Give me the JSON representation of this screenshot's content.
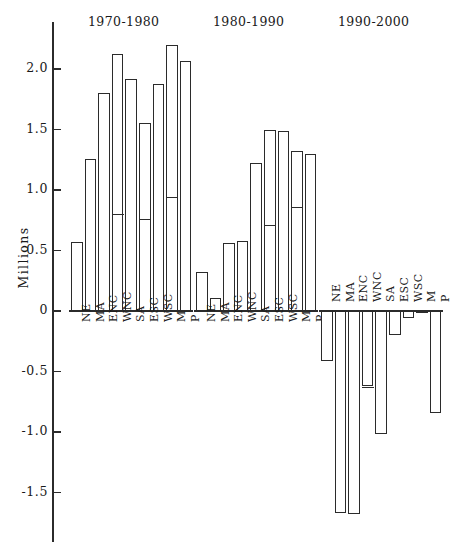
{
  "axis": {
    "y_title": "Millions",
    "ticks": [
      {
        "label": "2.0",
        "value": 2.0
      },
      {
        "label": "1.5",
        "value": 1.5
      },
      {
        "label": "1.0",
        "value": 1.0
      },
      {
        "label": "0.5",
        "value": 0.5
      },
      {
        "label": "0",
        "value": 0.0
      },
      {
        "label": "-0.5",
        "value": -0.5
      },
      {
        "label": "-1.0",
        "value": -1.0
      },
      {
        "label": "-1.5",
        "value": -1.5
      }
    ]
  },
  "chart_data": {
    "type": "bar",
    "title": "",
    "xlabel": "",
    "ylabel": "Millions",
    "ylim": [
      -1.8,
      2.3
    ],
    "grid": false,
    "legend": "none",
    "categories": [
      "NE",
      "MA",
      "ENC",
      "WNC",
      "SA",
      "ESC",
      "WSC",
      "M",
      "P"
    ],
    "panels": [
      {
        "title": "1970-1980",
        "values": [
          0.57,
          1.26,
          1.8,
          2.12,
          1.92,
          1.55,
          1.88,
          2.2,
          2.07
        ],
        "inner_marks": [
          null,
          null,
          null,
          0.81,
          null,
          0.77,
          null,
          0.95,
          null
        ]
      },
      {
        "title": "1980-1990",
        "values": [
          0.32,
          0.11,
          0.56,
          0.58,
          1.22,
          1.5,
          1.49,
          1.32,
          1.3
        ],
        "inner_marks": [
          null,
          null,
          null,
          null,
          null,
          0.72,
          null,
          0.87,
          null
        ]
      },
      {
        "title": "1990-2000",
        "values": [
          -0.41,
          -1.67,
          -1.68,
          -0.62,
          -1.02,
          -0.2,
          -0.06,
          -0.02,
          -0.84
        ],
        "inner_marks": [
          null,
          null,
          null,
          -0.62,
          null,
          null,
          null,
          null,
          null
        ]
      }
    ]
  }
}
